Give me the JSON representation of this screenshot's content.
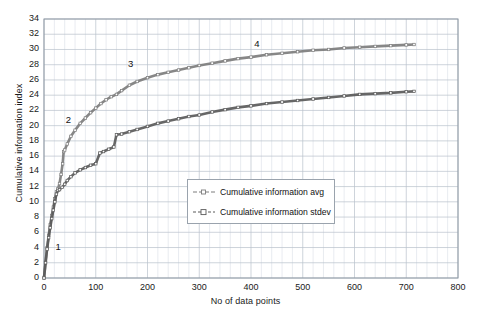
{
  "chart_data": {
    "type": "line",
    "title": "",
    "xlabel": "No of data points",
    "ylabel": "Cumulative information index",
    "xlim": [
      0,
      800
    ],
    "ylim": [
      0,
      34
    ],
    "xticks": [
      0,
      100,
      200,
      300,
      400,
      500,
      600,
      700,
      800
    ],
    "yticks": [
      0,
      2,
      4,
      6,
      8,
      10,
      12,
      14,
      16,
      18,
      20,
      22,
      24,
      26,
      28,
      30,
      32,
      34
    ],
    "grid": true,
    "minor_grid_x_step": 20,
    "legend_position": "center",
    "series": [
      {
        "name": "Cumulative information avg",
        "color": "#7d7d7d",
        "marker": "tick",
        "points": [
          [
            0,
            0
          ],
          [
            3,
            2.1
          ],
          [
            6,
            4.0
          ],
          [
            9,
            5.6
          ],
          [
            12,
            7.0
          ],
          [
            15,
            8.2
          ],
          [
            18,
            9.3
          ],
          [
            21,
            10.4
          ],
          [
            24,
            11.3
          ],
          [
            27,
            11.7
          ],
          [
            30,
            12.4
          ],
          [
            33,
            13.6
          ],
          [
            36,
            15.0
          ],
          [
            38,
            16.6
          ],
          [
            40,
            16.8
          ],
          [
            45,
            17.6
          ],
          [
            52,
            18.6
          ],
          [
            60,
            19.4
          ],
          [
            70,
            20.3
          ],
          [
            80,
            21.0
          ],
          [
            90,
            21.7
          ],
          [
            100,
            22.3
          ],
          [
            110,
            22.9
          ],
          [
            120,
            23.4
          ],
          [
            130,
            23.8
          ],
          [
            140,
            24.1
          ],
          [
            150,
            24.6
          ],
          [
            165,
            25.3
          ],
          [
            180,
            25.8
          ],
          [
            200,
            26.3
          ],
          [
            220,
            26.7
          ],
          [
            240,
            27.0
          ],
          [
            260,
            27.3
          ],
          [
            280,
            27.6
          ],
          [
            300,
            27.9
          ],
          [
            325,
            28.2
          ],
          [
            350,
            28.5
          ],
          [
            375,
            28.8
          ],
          [
            400,
            29.0
          ],
          [
            430,
            29.3
          ],
          [
            460,
            29.5
          ],
          [
            490,
            29.7
          ],
          [
            520,
            29.9
          ],
          [
            550,
            30.0
          ],
          [
            580,
            30.2
          ],
          [
            610,
            30.3
          ],
          [
            640,
            30.4
          ],
          [
            670,
            30.5
          ],
          [
            700,
            30.6
          ],
          [
            715,
            30.65
          ]
        ]
      },
      {
        "name": "Cumulative information stdev",
        "color": "#5a5a5a",
        "marker": "square",
        "points": [
          [
            0,
            0
          ],
          [
            3,
            2.0
          ],
          [
            6,
            3.8
          ],
          [
            9,
            5.3
          ],
          [
            12,
            6.6
          ],
          [
            15,
            7.8
          ],
          [
            18,
            8.9
          ],
          [
            21,
            10.0
          ],
          [
            24,
            11.0
          ],
          [
            27,
            11.5
          ],
          [
            30,
            11.6
          ],
          [
            35,
            11.9
          ],
          [
            40,
            12.3
          ],
          [
            45,
            12.8
          ],
          [
            52,
            13.3
          ],
          [
            60,
            13.8
          ],
          [
            70,
            14.2
          ],
          [
            80,
            14.5
          ],
          [
            90,
            14.8
          ],
          [
            100,
            15.0
          ],
          [
            108,
            16.4
          ],
          [
            115,
            16.6
          ],
          [
            125,
            16.9
          ],
          [
            135,
            17.2
          ],
          [
            140,
            18.8
          ],
          [
            150,
            18.9
          ],
          [
            165,
            19.2
          ],
          [
            180,
            19.5
          ],
          [
            200,
            19.9
          ],
          [
            220,
            20.3
          ],
          [
            240,
            20.6
          ],
          [
            260,
            20.9
          ],
          [
            280,
            21.2
          ],
          [
            300,
            21.4
          ],
          [
            325,
            21.8
          ],
          [
            350,
            22.1
          ],
          [
            375,
            22.4
          ],
          [
            400,
            22.6
          ],
          [
            430,
            22.9
          ],
          [
            460,
            23.1
          ],
          [
            490,
            23.3
          ],
          [
            520,
            23.5
          ],
          [
            550,
            23.7
          ],
          [
            580,
            23.9
          ],
          [
            610,
            24.1
          ],
          [
            640,
            24.2
          ],
          [
            670,
            24.3
          ],
          [
            700,
            24.45
          ],
          [
            715,
            24.5
          ]
        ]
      }
    ],
    "annotations": [
      {
        "label": "1",
        "x": 28,
        "y": 4.0
      },
      {
        "label": "2",
        "x": 48,
        "y": 20.6
      },
      {
        "label": "3",
        "x": 168,
        "y": 28.0
      },
      {
        "label": "4",
        "x": 412,
        "y": 30.6
      }
    ]
  },
  "legend": {
    "items": [
      {
        "label": "Cumulative information avg"
      },
      {
        "label": "Cumulative information stdev"
      }
    ]
  },
  "colors": {
    "series_avg": "#7d7d7d",
    "series_stdev": "#5a5a5a",
    "grid_major": "#b9c2cc",
    "grid_minor": "#d8dee5",
    "frame": "#8e98a3"
  }
}
